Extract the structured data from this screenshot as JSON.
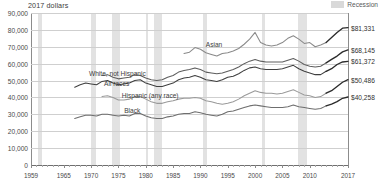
{
  "unit_label": "2017 dollars",
  "legend": {
    "recession_label": "Recession",
    "recession_color": "#e2e2e2"
  },
  "chart_data": {
    "type": "line",
    "title": "",
    "subtitle": "",
    "xlabel": "",
    "ylabel": "2017 dollars",
    "xlim": [
      1959,
      2017
    ],
    "ylim": [
      0,
      90000
    ],
    "grid": true,
    "legend_position": "top-right",
    "y_ticks": [
      0,
      10000,
      20000,
      30000,
      40000,
      50000,
      60000,
      70000,
      80000,
      90000
    ],
    "y_tick_labels": [
      "0",
      "10,000",
      "20,000",
      "30,000",
      "40,000",
      "50,000",
      "60,000",
      "70,000",
      "80,000",
      "90,000"
    ],
    "x_ticks": [
      1959,
      1965,
      1970,
      1975,
      1980,
      1985,
      1990,
      1995,
      2000,
      2005,
      2010,
      2017
    ],
    "x_tick_labels": [
      "1959",
      "1965",
      "1970",
      "1975",
      "1980",
      "1985",
      "1990",
      "1995",
      "2000",
      "2005",
      "2010",
      "2017"
    ],
    "recessions": [
      {
        "start": 1960.3,
        "end": 1961.1
      },
      {
        "start": 1969.9,
        "end": 1970.9
      },
      {
        "start": 1973.9,
        "end": 1975.2
      },
      {
        "start": 1980.1,
        "end": 1980.5
      },
      {
        "start": 1981.5,
        "end": 1982.9
      },
      {
        "start": 1990.5,
        "end": 1991.2
      },
      {
        "start": 2001.2,
        "end": 2001.9
      },
      {
        "start": 2007.9,
        "end": 2009.5
      }
    ],
    "series": [
      {
        "name": "Asian",
        "color": "#8a8a8a",
        "end_value": 81331,
        "end_label": "$81,331",
        "label_x": 1994,
        "label_y": 71500,
        "label_align": "right",
        "x": [
          1987,
          1988,
          1989,
          1990,
          1991,
          1992,
          1993,
          1994,
          1995,
          1996,
          1997,
          1998,
          1999,
          2000,
          2001,
          2002,
          2003,
          2004,
          2005,
          2006,
          2007,
          2008,
          2009,
          2010,
          2011,
          2012,
          2013,
          2014,
          2015,
          2016,
          2017
        ],
        "values": [
          66000,
          66800,
          69500,
          68500,
          66500,
          65500,
          64500,
          66000,
          66500,
          67500,
          69000,
          71500,
          74500,
          78500,
          72500,
          71000,
          70500,
          71000,
          72500,
          75000,
          76500,
          74500,
          72000,
          72500,
          70000,
          71000,
          72500,
          75500,
          78500,
          81000,
          81331
        ]
      },
      {
        "name": "White, not Hispanic",
        "color": "#5e5e5e",
        "end_value": 68145,
        "end_label": "$68,145",
        "label_x": 1980,
        "label_y": 54500,
        "label_align": "right",
        "x": [
          1972,
          1973,
          1974,
          1975,
          1976,
          1977,
          1978,
          1979,
          1980,
          1981,
          1982,
          1983,
          1984,
          1985,
          1986,
          1987,
          1988,
          1989,
          1990,
          1991,
          1992,
          1993,
          1994,
          1995,
          1996,
          1997,
          1998,
          1999,
          2000,
          2001,
          2002,
          2003,
          2004,
          2005,
          2006,
          2007,
          2008,
          2009,
          2010,
          2011,
          2012,
          2013,
          2014,
          2015,
          2016,
          2017
        ],
        "values": [
          53000,
          53500,
          52000,
          51000,
          51500,
          52000,
          53500,
          53000,
          51500,
          50500,
          50000,
          50500,
          52000,
          53000,
          55000,
          56000,
          56500,
          57500,
          56500,
          55000,
          54500,
          54000,
          54500,
          55500,
          56500,
          58000,
          60000,
          61500,
          62500,
          61500,
          61000,
          61000,
          61000,
          61000,
          62000,
          63000,
          61500,
          59500,
          58500,
          58000,
          58500,
          60500,
          62500,
          64500,
          67000,
          68145
        ]
      },
      {
        "name": "All races",
        "color": "#3f3f3f",
        "end_value": 61372,
        "end_label": "$61,372",
        "label_x": 1977,
        "label_y": 48500,
        "label_align": "right",
        "x": [
          1967,
          1968,
          1969,
          1970,
          1971,
          1972,
          1973,
          1974,
          1975,
          1976,
          1977,
          1978,
          1979,
          1980,
          1981,
          1982,
          1983,
          1984,
          1985,
          1986,
          1987,
          1988,
          1989,
          1990,
          1991,
          1992,
          1993,
          1994,
          1995,
          1996,
          1997,
          1998,
          1999,
          2000,
          2001,
          2002,
          2003,
          2004,
          2005,
          2006,
          2007,
          2008,
          2009,
          2010,
          2011,
          2012,
          2013,
          2014,
          2015,
          2016,
          2017
        ],
        "values": [
          46000,
          47500,
          48500,
          48000,
          47500,
          49500,
          50000,
          48500,
          47500,
          48000,
          48500,
          50000,
          50500,
          48500,
          47500,
          46500,
          46500,
          47500,
          48500,
          50500,
          51500,
          52000,
          53000,
          52000,
          50500,
          50000,
          49500,
          50500,
          52000,
          52500,
          54000,
          56000,
          57500,
          58000,
          57000,
          56500,
          56500,
          56500,
          57000,
          58000,
          59000,
          57000,
          55500,
          54500,
          53500,
          53500,
          55500,
          57000,
          59500,
          61000,
          61372
        ]
      },
      {
        "name": "Hispanic (any race)",
        "color": "#9a9a9a",
        "end_value": 50486,
        "end_label": "$50,486",
        "label_x": 1986,
        "label_y": 41500,
        "label_align": "right",
        "x": [
          1972,
          1973,
          1974,
          1975,
          1976,
          1977,
          1978,
          1979,
          1980,
          1981,
          1982,
          1983,
          1984,
          1985,
          1986,
          1987,
          1988,
          1989,
          1990,
          1991,
          1992,
          1993,
          1994,
          1995,
          1996,
          1997,
          1998,
          1999,
          2000,
          2001,
          2002,
          2003,
          2004,
          2005,
          2006,
          2007,
          2008,
          2009,
          2010,
          2011,
          2012,
          2013,
          2014,
          2015,
          2016,
          2017
        ],
        "values": [
          40500,
          41000,
          40000,
          38500,
          38500,
          39000,
          40500,
          40500,
          39000,
          37500,
          36500,
          36500,
          37500,
          38000,
          39000,
          39500,
          39500,
          40000,
          39500,
          38000,
          37500,
          36500,
          36000,
          36500,
          37500,
          39000,
          41000,
          42500,
          44000,
          43000,
          42500,
          42500,
          42000,
          42500,
          43500,
          44500,
          43000,
          41500,
          41000,
          40000,
          40500,
          42500,
          44000,
          46500,
          49000,
          50486
        ]
      },
      {
        "name": "Black",
        "color": "#6e6e6e",
        "end_value": 40258,
        "end_label": "$40,258",
        "label_x": 1979,
        "label_y": 32500,
        "label_align": "right",
        "x": [
          1967,
          1968,
          1969,
          1970,
          1971,
          1972,
          1973,
          1974,
          1975,
          1976,
          1977,
          1978,
          1979,
          1980,
          1981,
          1982,
          1983,
          1984,
          1985,
          1986,
          1987,
          1988,
          1989,
          1990,
          1991,
          1992,
          1993,
          1994,
          1995,
          1996,
          1997,
          1998,
          1999,
          2000,
          2001,
          2002,
          2003,
          2004,
          2005,
          2006,
          2007,
          2008,
          2009,
          2010,
          2011,
          2012,
          2013,
          2014,
          2015,
          2016,
          2017
        ],
        "values": [
          27500,
          28500,
          29500,
          29500,
          29000,
          30000,
          30000,
          29500,
          29000,
          29500,
          29000,
          30500,
          30500,
          29000,
          28000,
          27500,
          27500,
          28500,
          29000,
          30000,
          30500,
          30500,
          31500,
          31000,
          30000,
          29500,
          29000,
          30000,
          31500,
          32000,
          33000,
          34000,
          35000,
          35500,
          35000,
          34500,
          34000,
          34000,
          34000,
          34500,
          35500,
          34500,
          34000,
          33500,
          33000,
          33500,
          35000,
          36000,
          37500,
          39500,
          40258
        ]
      }
    ],
    "break_note": "final segment drawn darker (redesigned income questions)"
  }
}
